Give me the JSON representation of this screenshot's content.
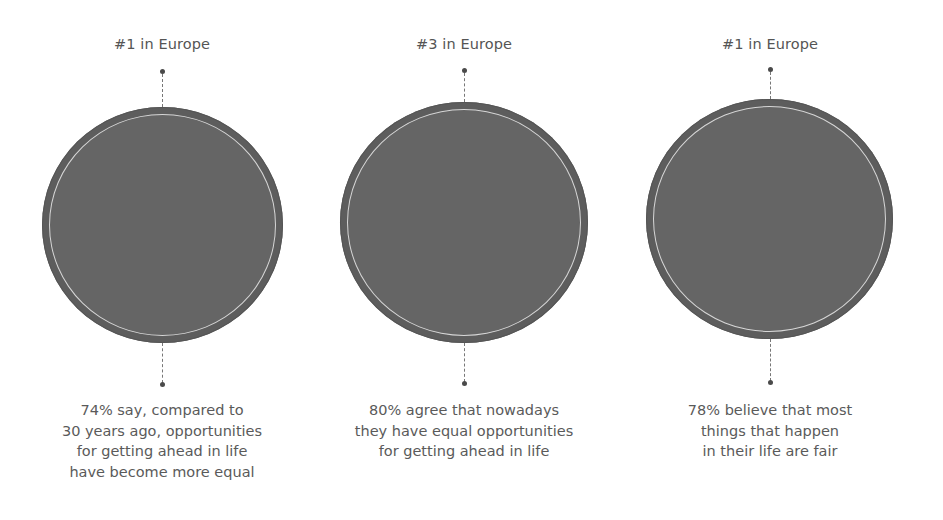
{
  "stats": [
    {
      "rank": "#1 in Europe",
      "value_percent": 74,
      "caption_lines": [
        "74% say, compared to",
        "30 years ago, opportunities",
        "for getting ahead in life",
        "have become more equal"
      ]
    },
    {
      "rank": "#3 in Europe",
      "value_percent": 80,
      "caption_lines": [
        "80% agree that nowadays",
        "they have equal opportunities",
        "for getting ahead in life"
      ]
    },
    {
      "rank": "#1 in Europe",
      "value_percent": 78,
      "caption_lines": [
        "78% believe that most",
        "things that happen",
        "in their life are fair"
      ]
    }
  ],
  "colors": {
    "circle_fill": "#656565",
    "circle_ring": "#5d5d5d",
    "inner_ring_line": "#d6d6d6",
    "text": "#555555"
  }
}
